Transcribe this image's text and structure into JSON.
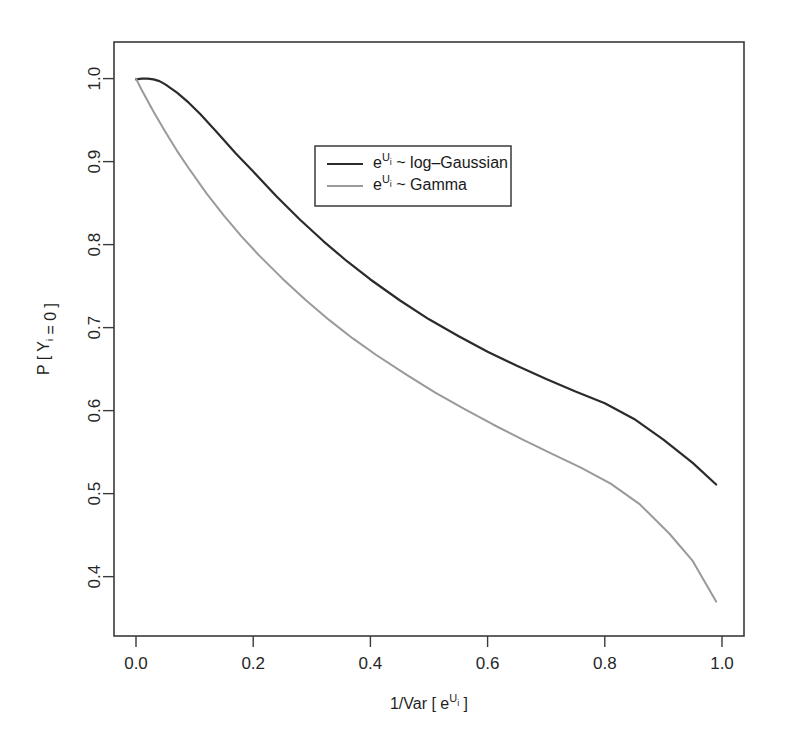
{
  "figure": {
    "background_color": "#ffffff",
    "frame_color": "#3a3a3a"
  },
  "chart_data": {
    "type": "line",
    "title": "",
    "subtitle": "",
    "xlabel": "1/Var [ e^{U_i} ]",
    "ylabel": "P [ Y_i = 0 ]",
    "xlabel_parts": {
      "pre": "1/Var [ e",
      "sup": "U",
      "sub": "i",
      "post": " ]"
    },
    "ylabel_parts": {
      "pre": "P [ Y",
      "sub": "i",
      "post": " = 0 ]"
    },
    "xlim": [
      0.0,
      1.0
    ],
    "ylim": [
      0.355,
      1.02
    ],
    "xticks": [
      0.0,
      0.2,
      0.4,
      0.6,
      0.8,
      1.0
    ],
    "xtick_labels": [
      "0.0",
      "0.2",
      "0.4",
      "0.6",
      "0.8",
      "1.0"
    ],
    "yticks": [
      0.4,
      0.5,
      0.6,
      0.7,
      0.8,
      0.9,
      1.0
    ],
    "ytick_labels": [
      "0.4",
      "0.5",
      "0.6",
      "0.7",
      "0.8",
      "0.9",
      "1.0"
    ],
    "grid": false,
    "legend_position": "upper-center-right",
    "series": [
      {
        "name": "log-Gaussian",
        "legend_label": "e^{U_i} ~ log-Gaussian",
        "legend_parts": {
          "pre": "e",
          "sup": "U",
          "sub": "i",
          "post": " ~ log–Gaussian"
        },
        "color": "#2b2b2b",
        "width": 2.2,
        "x": [
          0.0,
          0.01,
          0.02,
          0.03,
          0.04,
          0.05,
          0.07,
          0.09,
          0.11,
          0.14,
          0.17,
          0.2,
          0.24,
          0.28,
          0.32,
          0.36,
          0.4,
          0.45,
          0.5,
          0.55,
          0.6,
          0.65,
          0.7,
          0.75,
          0.8,
          0.85,
          0.9,
          0.95,
          0.99
        ],
        "y": [
          0.999,
          1.0,
          1.0,
          0.999,
          0.997,
          0.993,
          0.983,
          0.971,
          0.957,
          0.934,
          0.91,
          0.888,
          0.858,
          0.83,
          0.804,
          0.78,
          0.758,
          0.733,
          0.71,
          0.69,
          0.671,
          0.654,
          0.638,
          0.623,
          0.609,
          0.59,
          0.565,
          0.537,
          0.511
        ]
      },
      {
        "name": "Gamma",
        "legend_label": "e^{U_i} ~ Gamma",
        "legend_parts": {
          "pre": "e",
          "sup": "U",
          "sub": "i",
          "post": " ~ Gamma"
        },
        "color": "#9a9a9a",
        "width": 2.0,
        "x": [
          0.0,
          0.01,
          0.02,
          0.03,
          0.05,
          0.07,
          0.09,
          0.12,
          0.15,
          0.18,
          0.21,
          0.25,
          0.29,
          0.33,
          0.37,
          0.41,
          0.46,
          0.51,
          0.56,
          0.61,
          0.66,
          0.71,
          0.76,
          0.81,
          0.86,
          0.91,
          0.95,
          0.99
        ],
        "y": [
          1.0,
          0.986,
          0.973,
          0.96,
          0.936,
          0.913,
          0.892,
          0.862,
          0.835,
          0.81,
          0.787,
          0.759,
          0.733,
          0.709,
          0.687,
          0.667,
          0.644,
          0.622,
          0.602,
          0.583,
          0.565,
          0.548,
          0.531,
          0.512,
          0.487,
          0.452,
          0.419,
          0.37
        ]
      }
    ]
  }
}
